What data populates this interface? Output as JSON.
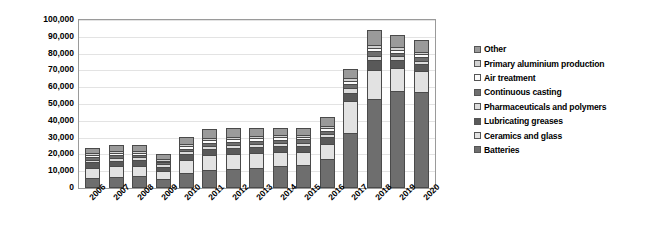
{
  "chart_data": {
    "type": "bar",
    "subtype": "stacked-column",
    "title": "",
    "xlabel": "",
    "ylabel": "Lithium production (t)",
    "ylim": [
      0,
      100000
    ],
    "ytick_step": 10000,
    "ytick_labels": [
      "100,000",
      "90,000",
      "80,000",
      "70,000",
      "60,000",
      "50,000",
      "40,000",
      "30,000",
      "20,000",
      "10,000",
      "0"
    ],
    "ytick_values": [
      100000,
      90000,
      80000,
      70000,
      60000,
      50000,
      40000,
      30000,
      20000,
      10000,
      0
    ],
    "grid": true,
    "grid_axis": "y",
    "legend_position": "right",
    "categories": [
      "2006",
      "2007",
      "2008",
      "2009",
      "2010",
      "2011",
      "2012",
      "2013",
      "2014",
      "2015",
      "2016",
      "2017",
      "2018",
      "2019",
      "2020"
    ],
    "stack_order_bottom_to_top": [
      "Batteries",
      "Ceramics and glass",
      "Lubricating greases",
      "Pharmaceuticals and polymers",
      "Continuous casting",
      "Air treatment",
      "Primary aluminium production",
      "Other"
    ],
    "series": [
      {
        "name": "Batteries",
        "color": "#6e6e6e",
        "values": [
          6000,
          6800,
          7000,
          5600,
          9200,
          11000,
          11500,
          12000,
          13000,
          13500,
          17500,
          33000,
          53000,
          57500,
          57000
        ]
      },
      {
        "name": "Ceramics and glass",
        "color": "#e2e2e2",
        "values": [
          6000,
          6200,
          6200,
          4700,
          7500,
          8800,
          9000,
          8800,
          8500,
          8200,
          8800,
          18500,
          17500,
          14000,
          12500
        ]
      },
      {
        "name": "Lubricating greases",
        "color": "#595959",
        "values": [
          3200,
          3300,
          3300,
          2500,
          3300,
          3500,
          3500,
          3500,
          3500,
          3500,
          3800,
          5200,
          5500,
          4500,
          4200
        ]
      },
      {
        "name": "Pharmaceuticals and polymers",
        "color": "#dcdcdc",
        "values": [
          1600,
          1700,
          1700,
          1300,
          1800,
          1900,
          1900,
          1900,
          1900,
          1900,
          2100,
          2600,
          2800,
          2400,
          2200
        ]
      },
      {
        "name": "Continuous casting",
        "color": "#6e6e6e",
        "values": [
          1500,
          1600,
          1600,
          1200,
          1700,
          1800,
          1800,
          1800,
          1800,
          1800,
          2000,
          2400,
          2600,
          2200,
          2000
        ]
      },
      {
        "name": "Air treatment",
        "color": "#fbfbfb",
        "values": [
          1200,
          1300,
          1300,
          1000,
          1400,
          1500,
          1500,
          1500,
          1500,
          1500,
          1600,
          2000,
          2100,
          1800,
          1700
        ]
      },
      {
        "name": "Primary aluminium production",
        "color": "#d2d2d2",
        "values": [
          1100,
          1100,
          1100,
          850,
          1200,
          1300,
          1300,
          1300,
          1300,
          1300,
          1400,
          1700,
          1800,
          1600,
          1500
        ]
      },
      {
        "name": "Other",
        "color": "#9a9a9a",
        "values": [
          3400,
          3500,
          3600,
          2850,
          4400,
          5200,
          5500,
          5200,
          4500,
          4300,
          5300,
          5600,
          8700,
          7000,
          6900
        ]
      }
    ],
    "totals": [
      24000,
      25500,
      25800,
      20000,
      30500,
      35000,
      36000,
      36000,
      36000,
      36000,
      42500,
      71000,
      94000,
      91000,
      88000
    ]
  },
  "legend": {
    "items": [
      {
        "label": "Other",
        "color": "#9a9a9a"
      },
      {
        "label": "Primary aluminium production",
        "color": "#d2d2d2"
      },
      {
        "label": "Air treatment",
        "color": "#fbfbfb"
      },
      {
        "label": "Continuous casting",
        "color": "#6e6e6e"
      },
      {
        "label": "Pharmaceuticals and polymers",
        "color": "#dcdcdc"
      },
      {
        "label": "Lubricating greases",
        "color": "#595959"
      },
      {
        "label": "Ceramics and glass",
        "color": "#e2e2e2"
      },
      {
        "label": "Batteries",
        "color": "#6e6e6e"
      }
    ]
  }
}
